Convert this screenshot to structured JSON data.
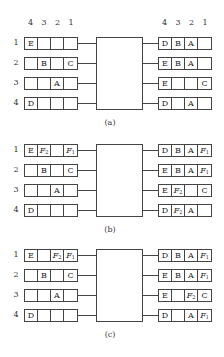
{
  "column_headers": [
    "4",
    "3",
    "2",
    "1"
  ],
  "row_labels": [
    "1",
    "2",
    "3",
    "4"
  ],
  "panels": [
    {
      "caption": "(a)",
      "top": 37,
      "inputs": [
        [
          "E",
          "",
          "",
          ""
        ],
        [
          "",
          "B",
          "",
          "C"
        ],
        [
          "",
          "",
          "A",
          ""
        ],
        [
          "D",
          "",
          "",
          ""
        ]
      ],
      "outputs": [
        [
          "D",
          "B",
          "A",
          ""
        ],
        [
          "E",
          "B",
          "A",
          ""
        ],
        [
          "E",
          "",
          "",
          "C"
        ],
        [
          "D",
          "",
          "A",
          ""
        ]
      ]
    },
    {
      "caption": "(b)",
      "top": 144,
      "inputs": [
        [
          "E",
          "F2",
          "",
          "F1"
        ],
        [
          "",
          "B",
          "",
          "C"
        ],
        [
          "",
          "",
          "A",
          ""
        ],
        [
          "D",
          "",
          "",
          ""
        ]
      ],
      "outputs": [
        [
          "D",
          "B",
          "A",
          "F1"
        ],
        [
          "E",
          "B",
          "A",
          "F1"
        ],
        [
          "E",
          "F2",
          "",
          "C"
        ],
        [
          "D",
          "F2",
          "A",
          ""
        ]
      ]
    },
    {
      "caption": "(c)",
      "top": 249,
      "inputs": [
        [
          "E",
          "",
          "F2",
          "F1"
        ],
        [
          "",
          "B",
          "",
          "C"
        ],
        [
          "",
          "",
          "A",
          ""
        ],
        [
          "D",
          "",
          "",
          ""
        ]
      ],
      "outputs": [
        [
          "D",
          "B",
          "A",
          "F1"
        ],
        [
          "E",
          "B",
          "A",
          "F1"
        ],
        [
          "E",
          "",
          "F2",
          "C"
        ],
        [
          "D",
          "",
          "A",
          "F1"
        ]
      ]
    }
  ]
}
